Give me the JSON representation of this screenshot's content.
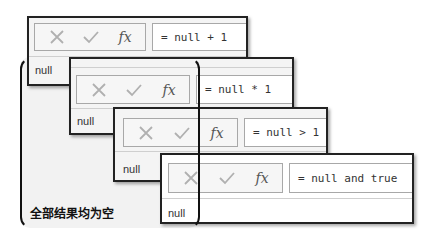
{
  "panels": [
    {
      "formula": "= null + 1",
      "result": "null"
    },
    {
      "formula": "= null * 1",
      "result": "null"
    },
    {
      "formula": "= null > 1",
      "result": "null"
    },
    {
      "formula": "= null and true",
      "result": "null"
    }
  ],
  "toolbar": {
    "cancel_icon": "close-icon",
    "commit_icon": "check-icon",
    "fx_label": "fx"
  },
  "caption": "全部结果均为空",
  "colors": {
    "border": "#222222",
    "icon_gray": "#b0b0b0",
    "panel_bg": "#f4f4f4",
    "bracket_bg": "#f2f2f2"
  }
}
